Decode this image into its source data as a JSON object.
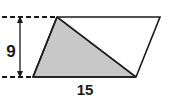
{
  "figure": {
    "kind": "geometry-diagram",
    "background_color": "#ffffff",
    "outline_color": "#1a1a1a",
    "shaded_fill_color": "#c8c8c8",
    "dimension_color": "#1a1a1a",
    "outline_width": 1.6,
    "parallelogram": {
      "name": "parallelogram-outline",
      "points": "57,17 160,17 136,77 33,77"
    },
    "shaded_triangle": {
      "name": "shaded-triangle",
      "points": "57,17 33,77 136,77"
    },
    "guides": {
      "top_dashed": {
        "x1": 2,
        "y1": 17,
        "x2": 57,
        "y2": 17
      },
      "bottom_dashed": {
        "x1": 2,
        "y1": 77,
        "x2": 33,
        "y2": 77
      },
      "dash_pattern": "5,3"
    },
    "height_dimension": {
      "label": "9",
      "x": 20,
      "y_top": 17,
      "y_bottom": 77,
      "label_x": 11,
      "label_y": 52
    },
    "base_dimension": {
      "label": "15",
      "label_x": 85,
      "label_y": 93
    }
  }
}
